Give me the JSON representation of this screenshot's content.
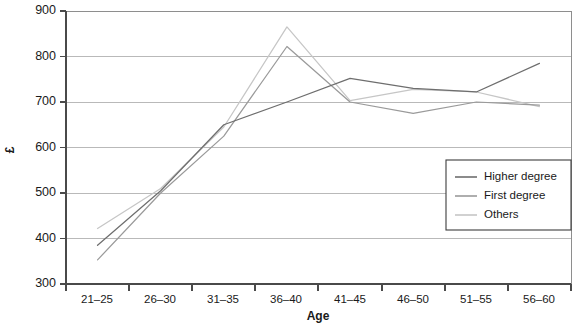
{
  "chart_data": {
    "type": "line",
    "title": "",
    "xlabel": "Age",
    "ylabel": "£",
    "categories": [
      "21–25",
      "26–30",
      "31–35",
      "36–40",
      "41–45",
      "46–50",
      "51–55",
      "56–60"
    ],
    "ylim": [
      300,
      900
    ],
    "yticks": [
      300,
      400,
      500,
      600,
      700,
      800,
      900
    ],
    "ytick_labels": [
      "300",
      "400",
      "500",
      "600",
      "700",
      "800",
      "900"
    ],
    "grid": true,
    "grid_axis": "y",
    "legend_position": "right-middle",
    "series": [
      {
        "name": "Higher degree",
        "color": "#6e6e6e",
        "values": [
          385,
          505,
          650,
          700,
          752,
          730,
          722,
          785
        ]
      },
      {
        "name": "First degree",
        "color": "#9a9a9a",
        "values": [
          353,
          500,
          625,
          822,
          700,
          675,
          700,
          693
        ]
      },
      {
        "name": "Others",
        "color": "#c6c6c6",
        "values": [
          422,
          510,
          645,
          865,
          703,
          728,
          722,
          690
        ]
      }
    ]
  },
  "axes": {
    "y_label": "£",
    "x_label": "Age",
    "y_ticks": [
      "900",
      "800",
      "700",
      "600",
      "500",
      "400",
      "300"
    ],
    "x_ticks": [
      "21–25",
      "26–30",
      "31–35",
      "36–40",
      "41–45",
      "46–50",
      "51–55",
      "56–60"
    ]
  },
  "legend": {
    "items": [
      {
        "label": "Higher degree"
      },
      {
        "label": "First degree"
      },
      {
        "label": "Others"
      }
    ]
  }
}
